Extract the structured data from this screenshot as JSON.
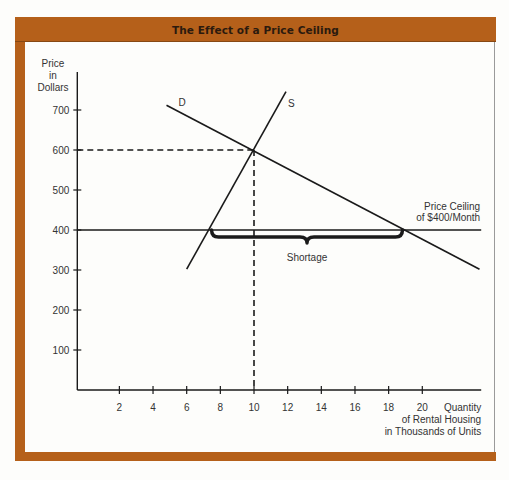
{
  "title": "The Effect of a Price Ceiling",
  "colors": {
    "frame": "#B5601A",
    "title_text": "#2B1A0E",
    "line": "#1A1A1A",
    "text": "#333333",
    "right_border": "#9A9A9A"
  },
  "chart_data": {
    "type": "line",
    "title": "The Effect of a Price Ceiling",
    "ylabel": [
      "Price",
      "in",
      "Dollars"
    ],
    "xlabel": [
      "Quantity",
      "of Rental Housing",
      "in Thousands of Units"
    ],
    "xticks": [
      2,
      4,
      6,
      8,
      10,
      12,
      14,
      16,
      18,
      20
    ],
    "yticks": [
      100,
      200,
      300,
      400,
      500,
      600,
      700
    ],
    "xlim": [
      -0.5,
      23.5
    ],
    "ylim": [
      0,
      795
    ],
    "grid": false,
    "legend": "none",
    "series": [
      {
        "name": "D",
        "label": "Demand",
        "points": [
          [
            4.8,
            712
          ],
          [
            23.4,
            302
          ]
        ]
      },
      {
        "name": "S",
        "label": "Supply",
        "points": [
          [
            6.0,
            302
          ],
          [
            11.9,
            746
          ]
        ]
      }
    ],
    "equilibrium": {
      "quantity": 10,
      "price": 600
    },
    "price_ceiling": {
      "price": 400,
      "label": [
        "Price Ceiling",
        "of $400/Month"
      ]
    },
    "shortage": {
      "label": "Shortage",
      "from_quantity": 7.3,
      "to_quantity": 19
    }
  }
}
